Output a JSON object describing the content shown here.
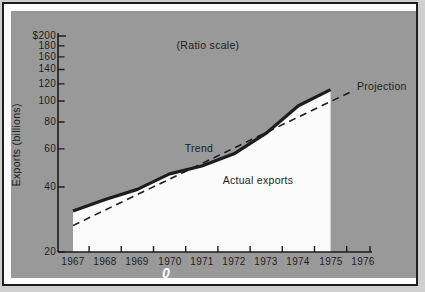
{
  "chart_data": {
    "type": "line",
    "title": "(Ratio scale)",
    "ylabel": "Exports (billions)",
    "y_scale": "log",
    "y_range": [
      20,
      200
    ],
    "y_tick_values": [
      200,
      180,
      160,
      140,
      120,
      100,
      80,
      60,
      40,
      20
    ],
    "y_tick_labels": [
      "$200",
      "180",
      "160",
      "140",
      "120",
      "100",
      "80",
      "60",
      "40",
      "20"
    ],
    "x_tick_labels": [
      "1967",
      "1968",
      "1969",
      "1970",
      "1971",
      "1972",
      "1973",
      "1974",
      "1975",
      "1976"
    ],
    "grid": false,
    "legend_position": "none",
    "series": [
      {
        "name": "Actual exports",
        "style": "solid-thick, white area fill below, ends 1975",
        "x": [
          1967,
          1968,
          1969,
          1970,
          1971,
          1972,
          1973,
          1974,
          1975
        ],
        "values": [
          31,
          35,
          39,
          46,
          50,
          57,
          71,
          95,
          113
        ]
      },
      {
        "name": "Trend / Projection",
        "style": "dashed straight line on ratio scale, extends to 1976",
        "x": [
          1967,
          1968,
          1969,
          1970,
          1971,
          1972,
          1973,
          1974,
          1975,
          1976
        ],
        "values": [
          26.5,
          31.3,
          36.9,
          43.5,
          51.3,
          60.6,
          71.5,
          84.3,
          99.5,
          117
        ]
      }
    ],
    "annotations": [
      {
        "text": "Trend"
      },
      {
        "text": "Actual exports"
      },
      {
        "text": "Projection"
      }
    ]
  },
  "marker": {
    "glyph": "0"
  },
  "colors": {
    "panel_bg": "#999999",
    "ink": "#1d1d1d",
    "area_fill": "#fbfbfb",
    "page_bg": "#fdfdfd",
    "frame": "#1f1f1f",
    "marker_color": "#ffffff"
  }
}
